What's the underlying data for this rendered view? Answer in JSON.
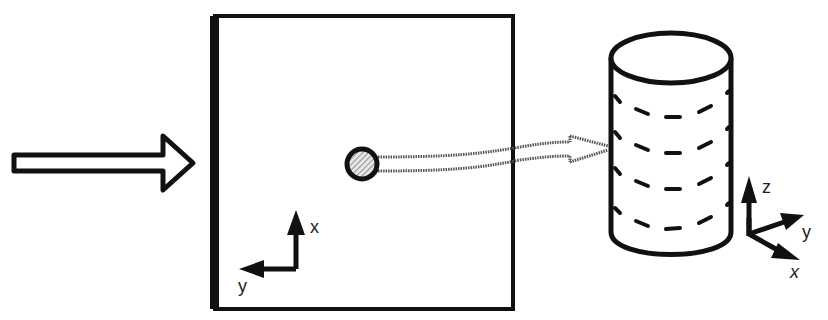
{
  "diagram": {
    "plate_axes": {
      "vertical_label": "x",
      "horizontal_label": "y"
    },
    "cylinder_axes": {
      "z_label": "z",
      "y_label": "y",
      "x_label": "x"
    },
    "colors": {
      "stroke": "#111111",
      "background": "#ffffff",
      "probe_fill": "#bbbbbb"
    }
  }
}
